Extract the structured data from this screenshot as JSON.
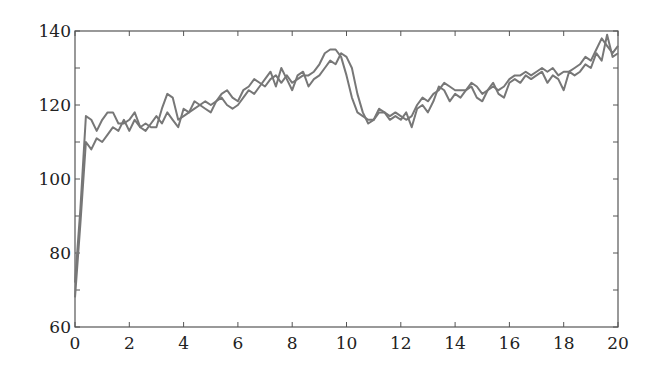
{
  "chart_data": {
    "type": "line",
    "title": "",
    "xlabel": "",
    "ylabel": "",
    "xlim": [
      0,
      20
    ],
    "ylim": [
      60,
      140
    ],
    "grid": false,
    "legend": null,
    "x_ticks": [
      0,
      2,
      4,
      6,
      8,
      10,
      12,
      14,
      16,
      18,
      20
    ],
    "y_ticks": [
      60,
      80,
      100,
      120,
      140
    ],
    "line_color": "#777777",
    "x": [
      0,
      0.2,
      0.4,
      0.6,
      0.8,
      1.0,
      1.2,
      1.4,
      1.6,
      1.8,
      2.0,
      2.2,
      2.4,
      2.6,
      2.8,
      3.0,
      3.2,
      3.4,
      3.6,
      3.8,
      4.0,
      4.2,
      4.4,
      4.6,
      4.8,
      5.0,
      5.2,
      5.4,
      5.6,
      5.8,
      6.0,
      6.2,
      6.4,
      6.6,
      6.8,
      7.0,
      7.2,
      7.4,
      7.6,
      7.8,
      8.0,
      8.2,
      8.4,
      8.6,
      8.8,
      9.0,
      9.2,
      9.4,
      9.6,
      9.8,
      10.0,
      10.2,
      10.4,
      10.6,
      10.8,
      11.0,
      11.2,
      11.4,
      11.6,
      11.8,
      12.0,
      12.2,
      12.4,
      12.6,
      12.8,
      13.0,
      13.2,
      13.4,
      13.6,
      13.8,
      14.0,
      14.2,
      14.4,
      14.6,
      14.8,
      15.0,
      15.2,
      15.4,
      15.6,
      15.8,
      16.0,
      16.2,
      16.4,
      16.6,
      16.8,
      17.0,
      17.2,
      17.4,
      17.6,
      17.8,
      18.0,
      18.2,
      18.4,
      18.6,
      18.8,
      19.0,
      19.2,
      19.4,
      19.6,
      19.8,
      20.0
    ],
    "series": [
      {
        "name": "series-1",
        "values": [
          72,
          92,
          117,
          116,
          113,
          116,
          118,
          118,
          115,
          115,
          116,
          118,
          114,
          115,
          114,
          114,
          119,
          123,
          122,
          116,
          117,
          118,
          119,
          120,
          121,
          120,
          121,
          123,
          124,
          122,
          121,
          124,
          125,
          127,
          126,
          125,
          127,
          128,
          126,
          128,
          126,
          127,
          128,
          128,
          129,
          131,
          134,
          135,
          135,
          133,
          128,
          122,
          118,
          117,
          116,
          116,
          118,
          118,
          117,
          118,
          117,
          116,
          117,
          120,
          122,
          121,
          123,
          124,
          126,
          125,
          124,
          124,
          124,
          126,
          125,
          123,
          124,
          125,
          124,
          125,
          127,
          128,
          128,
          129,
          128,
          129,
          130,
          129,
          130,
          128,
          129,
          129,
          130,
          131,
          133,
          132,
          135,
          138,
          136,
          134,
          136
        ]
      },
      {
        "name": "series-2",
        "values": [
          68,
          88,
          110,
          108,
          111,
          110,
          112,
          114,
          113,
          116,
          113,
          116,
          114,
          113,
          115,
          117,
          115,
          118,
          116,
          114,
          119,
          118,
          121,
          120,
          119,
          118,
          121,
          122,
          120,
          119,
          120,
          122,
          124,
          123,
          125,
          127,
          129,
          125,
          130,
          127,
          124,
          128,
          129,
          125,
          127,
          128,
          130,
          132,
          131,
          134,
          133,
          130,
          123,
          118,
          115,
          116,
          119,
          118,
          116,
          117,
          116,
          118,
          114,
          119,
          120,
          118,
          121,
          125,
          124,
          121,
          123,
          122,
          124,
          125,
          122,
          121,
          124,
          126,
          123,
          122,
          126,
          127,
          126,
          128,
          127,
          128,
          129,
          126,
          128,
          127,
          124,
          129,
          128,
          129,
          131,
          130,
          134,
          132,
          139,
          133,
          134
        ]
      }
    ]
  }
}
